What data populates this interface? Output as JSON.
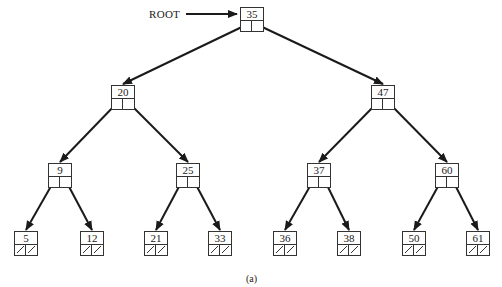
{
  "diagram": {
    "type": "binary-search-tree",
    "root_label": "ROOT",
    "caption": "(a)",
    "colors": {
      "line": "#1a1a1a",
      "box_border": "#333333",
      "background": "#ffffff"
    }
  },
  "nodes": [
    {
      "id": "n35",
      "key": "35",
      "x": 240,
      "y": 7,
      "left": "n20",
      "right": "n47",
      "null_left": false,
      "null_right": false
    },
    {
      "id": "n20",
      "key": "20",
      "x": 111,
      "y": 85,
      "left": "n9",
      "right": "n25",
      "null_left": false,
      "null_right": false
    },
    {
      "id": "n47",
      "key": "47",
      "x": 371,
      "y": 85,
      "left": "n37",
      "right": "n60",
      "null_left": false,
      "null_right": false
    },
    {
      "id": "n9",
      "key": "9",
      "x": 48,
      "y": 163,
      "left": "n5",
      "right": "n12",
      "null_left": false,
      "null_right": false
    },
    {
      "id": "n25",
      "key": "25",
      "x": 176,
      "y": 163,
      "left": "n21",
      "right": "n33",
      "null_left": false,
      "null_right": false
    },
    {
      "id": "n37",
      "key": "37",
      "x": 307,
      "y": 163,
      "left": "n36",
      "right": "n38",
      "null_left": false,
      "null_right": false
    },
    {
      "id": "n60",
      "key": "60",
      "x": 435,
      "y": 163,
      "left": "n50",
      "right": "n61",
      "null_left": false,
      "null_right": false
    },
    {
      "id": "n5",
      "key": "5",
      "x": 14,
      "y": 231,
      "null_left": true,
      "null_right": true
    },
    {
      "id": "n12",
      "key": "12",
      "x": 80,
      "y": 231,
      "null_left": true,
      "null_right": true
    },
    {
      "id": "n21",
      "key": "21",
      "x": 144,
      "y": 231,
      "null_left": true,
      "null_right": true
    },
    {
      "id": "n33",
      "key": "33",
      "x": 208,
      "y": 231,
      "null_left": true,
      "null_right": true
    },
    {
      "id": "n36",
      "key": "36",
      "x": 273,
      "y": 231,
      "null_left": true,
      "null_right": true
    },
    {
      "id": "n38",
      "key": "38",
      "x": 337,
      "y": 231,
      "null_left": true,
      "null_right": true
    },
    {
      "id": "n50",
      "key": "50",
      "x": 402,
      "y": 231,
      "null_left": true,
      "null_right": true
    },
    {
      "id": "n61",
      "key": "61",
      "x": 466,
      "y": 231,
      "null_left": true,
      "null_right": true
    }
  ]
}
